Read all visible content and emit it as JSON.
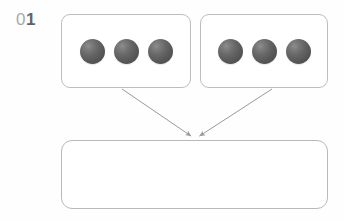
{
  "diagram": {
    "step_label": {
      "full": "01",
      "digit_light": "0",
      "digit_bold": "1"
    },
    "colors": {
      "background": "#fefefe",
      "box_border": "#bdbdbd",
      "arrow": "#9a9a9a",
      "sphere_dark": "#4e4e4e",
      "sphere_highlight": "#8e8e8e",
      "label_light": "#a9a9a9",
      "label_bold": "#636363"
    },
    "groups": [
      {
        "id": "group-left",
        "label": "",
        "item_count": 3,
        "items": [
          {
            "name": "sphere",
            "index": 1
          },
          {
            "name": "sphere",
            "index": 2
          },
          {
            "name": "sphere",
            "index": 3
          }
        ]
      },
      {
        "id": "group-right",
        "label": "",
        "item_count": 3,
        "items": [
          {
            "name": "sphere",
            "index": 1
          },
          {
            "name": "sphere",
            "index": 2
          },
          {
            "name": "sphere",
            "index": 3
          }
        ]
      }
    ],
    "target": {
      "id": "target-box",
      "label": "",
      "item_count": 0,
      "items": []
    },
    "arrows": [
      {
        "id": "arrow-left-to-target",
        "from": "group-left",
        "to": "target-box",
        "label": ""
      },
      {
        "id": "arrow-right-to-target",
        "from": "group-right",
        "to": "target-box",
        "label": ""
      }
    ]
  }
}
